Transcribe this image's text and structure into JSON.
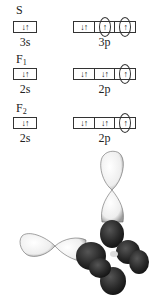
{
  "rows": [
    {
      "atom": "S",
      "atom_sub": "",
      "s_label": "3s",
      "p_label": "3p",
      "s_cell": "↓↑",
      "p_cells": [
        {
          "text": "↓↑",
          "circled": false
        },
        {
          "text": "↑",
          "circled": true
        },
        {
          "text": "↑",
          "circled": true
        }
      ]
    },
    {
      "atom": "F",
      "atom_sub": "1",
      "s_label": "2s",
      "p_label": "2p",
      "s_cell": "↓↑",
      "p_cells": [
        {
          "text": "↓↑",
          "circled": false
        },
        {
          "text": "↓↑",
          "circled": false
        },
        {
          "text": "↑",
          "circled": true
        }
      ]
    },
    {
      "atom": "F",
      "atom_sub": "2",
      "s_label": "2s",
      "p_label": "2p",
      "s_cell": "↓↑",
      "p_cells": [
        {
          "text": "↓↑",
          "circled": false
        },
        {
          "text": "↓↑",
          "circled": false
        },
        {
          "text": "↑",
          "circled": true
        }
      ]
    }
  ],
  "figure": {
    "colors": {
      "light_lobe": "#f2f2f2",
      "dark_lobe": "#2a2a2a",
      "outline": "#555555"
    }
  }
}
